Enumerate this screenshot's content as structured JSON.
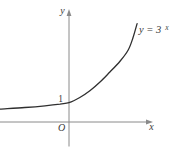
{
  "figure": {
    "background": "#ffffff",
    "axis_color": "#8a8a8a",
    "curve_color": "#2f2f2f",
    "text_color": "#3a3a3a",
    "labels": {
      "y_axis": "y",
      "x_axis": "x",
      "origin": "O",
      "y_intercept": "1",
      "equation_base": "y = 3",
      "equation_exponent": "x"
    }
  },
  "chart_data": {
    "type": "line",
    "function": "y = 3^x",
    "xlabel": "x",
    "ylabel": "y",
    "origin_label": "O",
    "grid": false,
    "legend": false,
    "axis_arrows": true,
    "x_range_drawn": [
      -1.47,
      1.45
    ],
    "y_range_drawn": [
      0.67,
      5.1
    ],
    "key_points": [
      {
        "x": 0,
        "y": 1,
        "label": "1"
      }
    ],
    "annotations": [
      {
        "text": "y = 3^x",
        "x": 1.45,
        "y": 5.1,
        "position": "right-of-curve-end"
      }
    ],
    "curve_points": [
      [
        -1.47,
        0.67
      ],
      [
        -0.94,
        0.75
      ],
      [
        -0.51,
        0.84
      ],
      [
        -0.19,
        0.93
      ],
      [
        0.0,
        1.0
      ],
      [
        0.23,
        1.27
      ],
      [
        0.45,
        1.63
      ],
      [
        0.66,
        2.07
      ],
      [
        0.87,
        2.59
      ],
      [
        1.09,
        3.16
      ],
      [
        1.26,
        3.73
      ],
      [
        1.36,
        4.35
      ],
      [
        1.45,
        5.1
      ]
    ]
  }
}
